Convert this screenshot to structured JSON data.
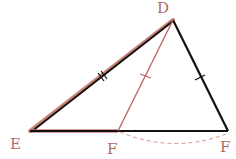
{
  "diagram": {
    "type": "geometry-triangle",
    "labels": {
      "top": "D",
      "left": "E",
      "middle_bottom": "F",
      "right_bottom": "F"
    },
    "colors": {
      "black_edge": "#111111",
      "brown_edge": "#b5655c",
      "label": "#b06a62",
      "dashed_arc": "#d9908a"
    },
    "points": {
      "D": [
        173,
        20
      ],
      "E": [
        30,
        131
      ],
      "F_mid": [
        118,
        131
      ],
      "F_right": [
        228,
        131
      ]
    },
    "marks": {
      "DE": "double-tick",
      "DF_mid": "single-tick",
      "DF_right": "single-tick"
    }
  }
}
